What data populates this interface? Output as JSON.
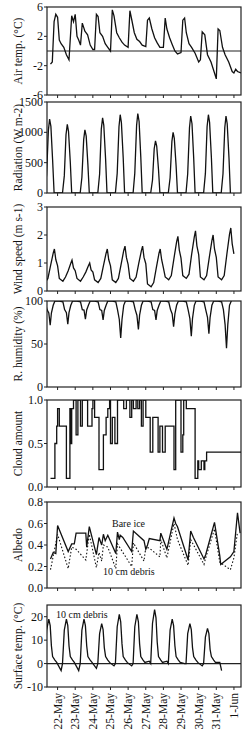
{
  "figure": {
    "x_ticks": [
      "22-May",
      "23-May",
      "24-May",
      "25-May",
      "26-May",
      "27-May",
      "28-May",
      "29-May",
      "30-May",
      "31-May",
      "1-Jun"
    ]
  },
  "chart_data": [
    {
      "type": "line",
      "id": "air_temp",
      "ylabel": "Air temp. (°C)",
      "ylim": [
        -6,
        6
      ],
      "yticks": [
        -6,
        -2,
        2,
        6
      ],
      "ref_line": 0,
      "x": [
        21.6,
        21.7,
        21.8,
        21.9,
        22.0,
        22.1,
        22.2,
        22.35,
        22.5,
        22.65,
        22.8,
        22.9,
        23.0,
        23.1,
        23.2,
        23.3,
        23.4,
        23.55,
        23.7,
        23.85,
        24.0,
        24.1,
        24.2,
        24.3,
        24.4,
        24.55,
        24.7,
        24.85,
        25.0,
        25.1,
        25.2,
        25.35,
        25.5,
        25.65,
        25.8,
        26.0,
        26.1,
        26.2,
        26.35,
        26.5,
        26.65,
        26.8,
        27.0,
        27.1,
        27.2,
        27.35,
        27.5,
        27.65,
        27.8,
        28.0,
        28.1,
        28.2,
        28.35,
        28.5,
        28.65,
        28.8,
        29.0,
        29.1,
        29.2,
        29.3,
        29.45,
        29.6,
        29.8,
        30.0,
        30.1,
        30.2,
        30.35,
        30.5,
        30.7,
        30.9,
        31.0,
        31.1,
        31.2,
        31.35,
        31.5,
        31.7,
        31.9,
        32.0,
        32.1,
        32.2,
        32.4
      ],
      "values": [
        -1.8,
        -1.5,
        4.0,
        5.0,
        4.6,
        1.5,
        1.0,
        0.5,
        -0.5,
        -1.2,
        4.8,
        4.0,
        5.0,
        2.0,
        1.5,
        0.8,
        3.8,
        2.7,
        2.2,
        0.8,
        0.2,
        0.2,
        5.0,
        4.7,
        2.5,
        2.0,
        1.0,
        0.5,
        0.0,
        5.6,
        4.8,
        2.5,
        1.8,
        1.2,
        0.8,
        0.5,
        5.5,
        4.3,
        2.5,
        1.6,
        1.3,
        0.8,
        0.6,
        4.2,
        4.5,
        3.0,
        1.8,
        1.1,
        0.5,
        0.5,
        4.5,
        3.0,
        1.8,
        0.9,
        0.0,
        -0.4,
        -0.2,
        4.2,
        4.5,
        2.5,
        1.0,
        0.5,
        -0.3,
        -1.5,
        -1.2,
        2.6,
        2.2,
        -0.5,
        -1.5,
        -3.0,
        -3.8,
        3.0,
        2.8,
        0.5,
        -0.5,
        -1.5,
        -2.8,
        -3.0,
        -2.5,
        -2.8,
        -3.0
      ]
    },
    {
      "type": "line",
      "id": "radiation",
      "ylabel": "Radiation (W m-2)",
      "ylim": [
        0,
        1500
      ],
      "yticks": [
        0,
        500,
        1000,
        1500
      ],
      "peaks": [
        1220,
        1130,
        1040,
        1240,
        1290,
        1310,
        860,
        1000,
        1270,
        1290,
        1270
      ]
    },
    {
      "type": "line",
      "id": "wind_speed",
      "ylabel": "Wind speed (m s-1)",
      "ylim": [
        0,
        3
      ],
      "yticks": [
        0,
        1,
        2,
        3
      ],
      "peaks": [
        1.5,
        1.1,
        1.0,
        1.5,
        1.6,
        1.6,
        1.5,
        1.95,
        2.15,
        2.0,
        2.25
      ],
      "troughs": [
        0.3,
        0.35,
        0.35,
        0.3,
        0.3,
        0.35,
        0.15,
        0.4,
        0.45,
        0.4,
        0.4
      ]
    },
    {
      "type": "line",
      "id": "humidity",
      "ylabel": "R. humidity (%)",
      "ylim": [
        0,
        100
      ],
      "yticks": [
        0,
        50,
        100
      ],
      "troughs": [
        72,
        73,
        79,
        78,
        57,
        67,
        78,
        70,
        59,
        62,
        45
      ]
    },
    {
      "type": "line",
      "id": "cloud",
      "ylabel": "Cloud amount",
      "ylim": [
        0.0,
        1.0
      ],
      "yticks": [
        "0.0",
        "0.5",
        "1.0"
      ],
      "x": [
        21.6,
        21.8,
        21.85,
        21.95,
        22.0,
        22.1,
        22.2,
        22.4,
        22.5,
        22.55,
        22.7,
        22.75,
        22.8,
        22.9,
        23.0,
        23.05,
        23.15,
        23.2,
        23.3,
        23.4,
        23.45,
        23.6,
        23.7,
        23.8,
        23.95,
        24.0,
        24.1,
        24.25,
        24.35,
        24.45,
        24.6,
        24.75,
        24.85,
        24.95,
        25.0,
        25.1,
        25.25,
        25.4,
        25.6,
        25.75,
        25.9,
        26.0,
        26.1,
        26.2,
        26.3,
        26.45,
        26.55,
        26.65,
        26.75,
        26.85,
        27.0,
        27.1,
        27.25,
        27.4,
        27.55,
        27.7,
        27.8,
        27.95,
        28.1,
        28.2,
        28.35,
        28.5,
        28.6,
        28.7,
        28.85,
        29.0,
        29.1,
        29.15,
        29.3,
        29.45,
        29.55,
        29.65,
        29.8,
        29.95,
        30.0,
        30.15,
        30.3,
        30.35,
        30.45,
        30.55,
        30.65,
        30.75,
        30.9,
        31.0,
        31.1,
        31.2,
        31.3,
        31.4,
        31.55,
        31.7,
        31.8,
        31.9,
        32.0,
        32.1,
        32.2,
        32.3,
        32.4
      ],
      "values": [
        0.1,
        0.1,
        0.5,
        0.7,
        0.9,
        0.7,
        0.7,
        0.7,
        0.1,
        0.1,
        0.9,
        0.5,
        0.9,
        1.0,
        1.0,
        0.6,
        1.0,
        1.0,
        0.7,
        1.0,
        1.0,
        1.0,
        0.7,
        0.7,
        0.9,
        1.0,
        0.8,
        0.8,
        0.2,
        0.2,
        0.6,
        0.8,
        0.9,
        1.0,
        0.5,
        0.8,
        0.5,
        1.0,
        1.0,
        0.9,
        1.0,
        1.0,
        0.8,
        1.0,
        0.9,
        1.0,
        0.9,
        1.0,
        0.7,
        1.0,
        0.8,
        0.8,
        0.4,
        0.8,
        0.8,
        0.4,
        0.7,
        0.4,
        0.7,
        0.7,
        0.7,
        0.7,
        0.2,
        1.0,
        1.0,
        0.4,
        0.6,
        1.0,
        0.9,
        0.9,
        0.9,
        0.9,
        0.1,
        0.3,
        0.2,
        0.3,
        0.2,
        0.3,
        0.4,
        0.4,
        0.4,
        0.4,
        0.4,
        0.4,
        0.4,
        0.4,
        0.4,
        0.4,
        0.4,
        0.4,
        0.4,
        0.4,
        0.4,
        0.4,
        0.4,
        0.4,
        0.4
      ],
      "note": "step-like cloud cover series"
    },
    {
      "type": "line",
      "id": "albedo",
      "ylabel": "Albedo",
      "ylim": [
        0.0,
        0.8
      ],
      "yticks": [
        "0.0",
        "0.2",
        "0.4",
        "0.6",
        "0.8"
      ],
      "annotations": [
        "Bare ice",
        "10 cm debris"
      ],
      "series": [
        {
          "name": "Bare ice",
          "style": "solid",
          "x": [
            21.6,
            21.75,
            21.9,
            22.0,
            22.6,
            22.8,
            22.95,
            23.05,
            23.6,
            23.65,
            23.8,
            24.2,
            24.35,
            24.5,
            24.6,
            24.7,
            24.85,
            25.3,
            25.4,
            25.5,
            25.55,
            25.7,
            26.2,
            26.3,
            26.9,
            27.0,
            27.1,
            27.2,
            27.8,
            27.85,
            28.2,
            28.6,
            28.7,
            28.8,
            29.4,
            29.55,
            29.7,
            30.3,
            30.4,
            30.9,
            31.2,
            31.25,
            31.8,
            32.0,
            32.2,
            32.35
          ],
          "values": [
            0.27,
            0.33,
            0.32,
            0.58,
            0.34,
            0.41,
            0.41,
            0.51,
            0.51,
            0.38,
            0.57,
            0.31,
            0.47,
            0.4,
            0.5,
            0.44,
            0.49,
            0.32,
            0.52,
            0.45,
            0.49,
            0.47,
            0.34,
            0.53,
            0.44,
            0.36,
            0.4,
            0.46,
            0.44,
            0.51,
            0.36,
            0.65,
            0.6,
            0.57,
            0.26,
            0.53,
            0.47,
            0.27,
            0.31,
            0.61,
            0.3,
            0.22,
            0.29,
            0.34,
            0.7,
            0.51
          ]
        },
        {
          "name": "10 cm debris",
          "style": "dotted",
          "x": [
            21.6,
            22.0,
            22.6,
            22.8,
            23.05,
            23.6,
            23.8,
            24.2,
            24.35,
            24.5,
            24.6,
            24.85,
            25.3,
            25.4,
            25.55,
            26.2,
            26.3,
            26.9,
            27.0,
            27.2,
            27.8,
            27.85,
            28.2,
            28.6,
            28.8,
            29.4,
            29.55,
            30.3,
            30.4,
            30.9,
            31.2,
            31.8,
            32.0,
            32.2
          ],
          "values": [
            0.17,
            0.5,
            0.18,
            0.38,
            0.36,
            0.26,
            0.5,
            0.19,
            0.33,
            0.25,
            0.4,
            0.38,
            0.18,
            0.41,
            0.37,
            0.2,
            0.42,
            0.25,
            0.38,
            0.37,
            0.29,
            0.45,
            0.28,
            0.6,
            0.45,
            0.21,
            0.45,
            0.22,
            0.28,
            0.55,
            0.24,
            0.17,
            0.28,
            0.52
          ]
        }
      ]
    },
    {
      "type": "line",
      "id": "surface_temp",
      "ylabel": "Surface temp. (°C)",
      "ylim": [
        -10,
        25
      ],
      "yticks": [
        -10,
        0,
        10,
        20
      ],
      "ref_line": 0,
      "annotations": [
        "10 cm debris"
      ],
      "peaks": [
        19,
        19,
        19,
        17,
        21,
        21,
        23,
        19,
        17,
        15
      ],
      "troughs": [
        -3,
        -3,
        -3,
        -2,
        -1,
        -1,
        1,
        1,
        0,
        -1,
        -3
      ]
    }
  ]
}
